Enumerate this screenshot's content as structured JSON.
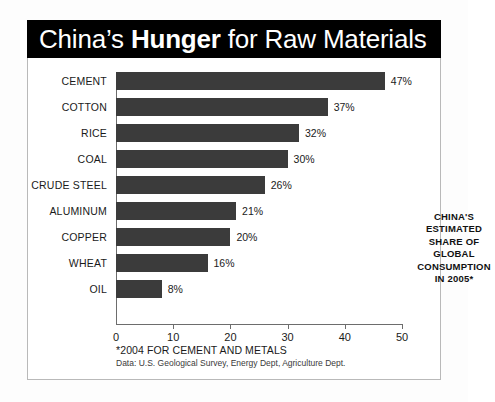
{
  "title": {
    "prefix": "China’s ",
    "emphasis": "Hunger",
    "suffix": " for Raw Materials"
  },
  "annotation": "CHINA'S ESTIMATED SHARE OF GLOBAL CONSUMPTION IN 2005*",
  "annotation_lines": [
    "CHINA'S",
    "ESTIMATED",
    "SHARE OF",
    "GLOBAL",
    "CONSUMPTION",
    "IN 2005*"
  ],
  "footnotes": {
    "primary": "*2004 FOR CEMENT AND METALS",
    "source": "Data: U.S. Geological Survey, Energy Dept, Agriculture Dept."
  },
  "colors": {
    "bar": "#3b3b3b",
    "banner": "#000000",
    "banner_text": "#ffffff",
    "axis": "#6d6d6d",
    "frame": "#b9b9b9"
  },
  "chart_data": {
    "type": "bar",
    "orientation": "horizontal",
    "title": "China’s Hunger for Raw Materials",
    "subtitle": "CHINA'S ESTIMATED SHARE OF GLOBAL CONSUMPTION IN 2005*",
    "xlabel": "",
    "ylabel": "",
    "xlim": [
      0,
      50
    ],
    "xticks": [
      0,
      10,
      20,
      30,
      40,
      50
    ],
    "xtick_labels": [
      "0",
      "10",
      "20",
      "30",
      "40",
      "50"
    ],
    "grid": false,
    "legend": false,
    "value_suffix": "%",
    "categories": [
      "CEMENT",
      "COTTON",
      "RICE",
      "COAL",
      "CRUDE STEEL",
      "ALUMINUM",
      "COPPER",
      "WHEAT",
      "OIL"
    ],
    "values": [
      47,
      37,
      32,
      30,
      26,
      21,
      20,
      16,
      8
    ],
    "value_labels": [
      "47%",
      "37%",
      "32%",
      "30%",
      "26%",
      "21%",
      "20%",
      "16%",
      "8%"
    ]
  }
}
